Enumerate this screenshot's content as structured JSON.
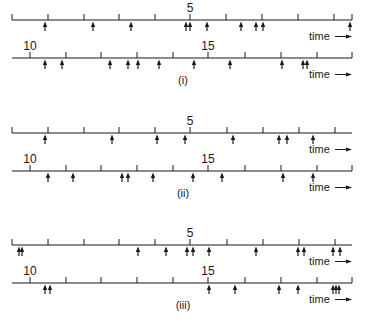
{
  "figure": {
    "colors": {
      "ink": "#1a1a1a",
      "background": "#ffffff"
    },
    "axis_label": "time",
    "panels": [
      {
        "label": "(i)",
        "label_pos": [
          183,
          84
        ],
        "rows": [
          {
            "y": 20,
            "x_start": 12,
            "x_end": 352,
            "ticks": [
              12,
              48,
              84,
              119,
              155,
              190,
              226,
              262,
              298,
              334,
              352
            ],
            "tick_labels": [
              {
                "x": 190,
                "text": "5"
              }
            ],
            "events": [
              45,
              93,
              131,
              186,
              190,
              207,
              241,
              256,
              263,
              350
            ],
            "show_time": true
          },
          {
            "y": 58,
            "x_start": 12,
            "x_end": 352,
            "ticks": [
              30,
              66,
              101,
              137,
              173,
              208,
              245,
              281,
              317,
              352
            ],
            "tick_labels": [
              {
                "x": 30,
                "text": "10"
              },
              {
                "x": 208,
                "text": "15"
              }
            ],
            "events": [
              45,
              62,
              110,
              128,
              138,
              159,
              194,
              230,
              282,
              303,
              307
            ],
            "show_time": true
          }
        ]
      },
      {
        "label": "(ii)",
        "label_pos": [
          183,
          197
        ],
        "rows": [
          {
            "y": 133,
            "x_start": 12,
            "x_end": 352,
            "ticks": [
              12,
              48,
              84,
              119,
              155,
              190,
              227,
              263,
              299,
              335
            ],
            "tick_labels": [
              {
                "x": 190,
                "text": "5"
              }
            ],
            "events": [
              45,
              112,
              157,
              185,
              233,
              279,
              287,
              313
            ],
            "show_time": true
          },
          {
            "y": 171,
            "x_start": 12,
            "x_end": 352,
            "ticks": [
              30,
              66,
              101,
              137,
              173,
              208,
              245,
              281,
              317,
              352
            ],
            "tick_labels": [
              {
                "x": 30,
                "text": "10"
              },
              {
                "x": 208,
                "text": "15"
              }
            ],
            "events": [
              48,
              73,
              122,
              128,
              153,
              193,
              222,
              283,
              313
            ],
            "show_time": true
          }
        ]
      },
      {
        "label": "(iii)",
        "label_pos": [
          183,
          309
        ],
        "rows": [
          {
            "y": 245,
            "x_start": 12,
            "x_end": 352,
            "ticks": [
              12,
              48,
              84,
              119,
              155,
              190,
              227,
              263,
              299,
              335
            ],
            "tick_labels": [
              {
                "x": 190,
                "text": "5"
              }
            ],
            "events": [
              19,
              22,
              138,
              166,
              187,
              193,
              209,
              256,
              298,
              304,
              333,
              340
            ],
            "show_time": true
          },
          {
            "y": 283,
            "x_start": 12,
            "x_end": 352,
            "ticks": [
              30,
              66,
              101,
              137,
              173,
              208,
              245,
              281,
              317,
              352
            ],
            "tick_labels": [
              {
                "x": 30,
                "text": "10"
              },
              {
                "x": 208,
                "text": "15"
              }
            ],
            "events": [
              45,
              50,
              209,
              235,
              279,
              298,
              333,
              336,
              339
            ],
            "show_time": true
          }
        ]
      }
    ]
  }
}
